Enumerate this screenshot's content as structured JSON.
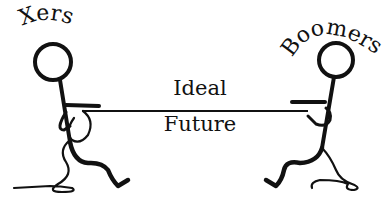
{
  "illustration": {
    "left_figure": {
      "label": "Xers"
    },
    "right_figure": {
      "label": "Boomers"
    },
    "rope": {
      "label_top": "Ideal",
      "label_bottom": "Future"
    }
  },
  "colors": {
    "ink": "#111111",
    "background": "#ffffff"
  }
}
